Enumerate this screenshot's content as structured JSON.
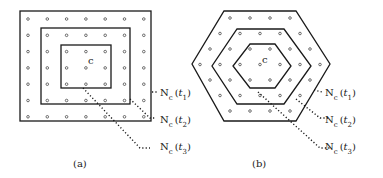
{
  "figure": {
    "panels": [
      {
        "id": "a",
        "caption": "(a)",
        "shape": "square",
        "center_label": "c",
        "neighborhood_labels": [
          {
            "base": "N",
            "sub": "c",
            "arg": "t",
            "arg_sub": "1"
          },
          {
            "base": "N",
            "sub": "c",
            "arg": "t",
            "arg_sub": "2"
          },
          {
            "base": "N",
            "sub": "c",
            "arg": "t",
            "arg_sub": "3"
          }
        ]
      },
      {
        "id": "b",
        "caption": "(b)",
        "shape": "hexagon",
        "center_label": "c",
        "neighborhood_labels": [
          {
            "base": "N",
            "sub": "c",
            "arg": "t",
            "arg_sub": "1"
          },
          {
            "base": "N",
            "sub": "c",
            "arg": "t",
            "arg_sub": "2"
          },
          {
            "base": "N",
            "sub": "c",
            "arg": "t",
            "arg_sub": "3"
          }
        ]
      }
    ]
  }
}
